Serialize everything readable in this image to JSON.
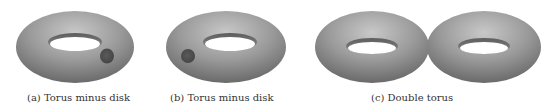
{
  "figure": {
    "panels": [
      {
        "id": "a",
        "caption": "(a) Torus minus disk",
        "shape": "torus-with-removed-disk",
        "disk_position": "right"
      },
      {
        "id": "b",
        "caption": "(b) Torus minus disk",
        "shape": "torus-with-removed-disk",
        "disk_position": "left"
      },
      {
        "id": "c",
        "caption": "(c) Double torus",
        "shape": "double-torus"
      }
    ],
    "colors": {
      "surface_light": "#c8c8c8",
      "surface_mid": "#9a9a9a",
      "surface_dark": "#6a6a6a",
      "disk": "#555555",
      "background": "#ffffff",
      "caption_text": "#333333"
    }
  }
}
